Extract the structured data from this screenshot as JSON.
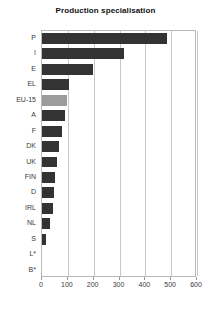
{
  "chart_data": {
    "type": "bar",
    "orientation": "horizontal",
    "title": "Production specialisation",
    "xlabel": "",
    "ylabel": "",
    "xlim": [
      0,
      600
    ],
    "ylim": null,
    "grid": true,
    "legend": false,
    "xticks": [
      0,
      100,
      200,
      300,
      400,
      500,
      600
    ],
    "categories": [
      "P",
      "I",
      "E",
      "EL",
      "EU-15",
      "A",
      "F",
      "DK",
      "UK",
      "FIN",
      "D",
      "IRL",
      "NL",
      "S",
      "L*",
      "B*"
    ],
    "values": [
      484,
      318,
      198,
      105,
      97,
      89,
      78,
      66,
      58,
      50,
      46,
      43,
      31,
      16,
      0,
      0
    ],
    "highlight_category": "EU-15",
    "colors": {
      "bar": "#333333",
      "highlight_bar": "#9c9c9c",
      "grid": "#c8c8c8",
      "axis": "#b9b9b9",
      "text": "#3a3a3a",
      "title": "#111111",
      "background": "#ffffff"
    }
  }
}
